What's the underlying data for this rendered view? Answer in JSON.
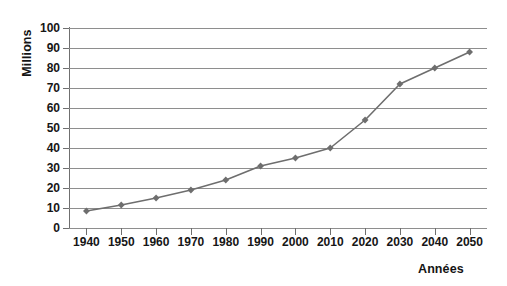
{
  "chart_data": {
    "type": "line",
    "title": "",
    "subtitle": "",
    "xlabel": "Années",
    "ylabel": "Millions",
    "categories": [
      "1940",
      "1950",
      "1960",
      "1970",
      "1980",
      "1990",
      "2000",
      "2010",
      "2020",
      "2030",
      "2040",
      "2050"
    ],
    "x": [
      1940,
      1950,
      1960,
      1970,
      1980,
      1990,
      2000,
      2010,
      2020,
      2030,
      2040,
      2050
    ],
    "values": [
      8.5,
      11.5,
      15,
      19,
      24,
      31,
      35,
      40,
      54,
      72,
      80,
      88
    ],
    "series": [
      {
        "name": "",
        "values": [
          8.5,
          11.5,
          15,
          19,
          24,
          31,
          35,
          40,
          54,
          72,
          80,
          88
        ]
      }
    ],
    "ylim": [
      0,
      100
    ],
    "ytick_labels": [
      "0",
      "10",
      "20",
      "30",
      "40",
      "50",
      "60",
      "70",
      "80",
      "90",
      "100"
    ],
    "ytick_values": [
      0,
      10,
      20,
      30,
      40,
      50,
      60,
      70,
      80,
      90,
      100
    ],
    "xtick_labels": [
      "1940",
      "1950",
      "1960",
      "1970",
      "1980",
      "1990",
      "2000",
      "2010",
      "2020",
      "2030",
      "2040",
      "2050"
    ],
    "grid": "horizontal",
    "legend": "none",
    "marker": "diamond",
    "line_color": "#6e6e6e",
    "marker_color": "#6e6e6e",
    "grid_color": "#8e8e8e",
    "axis_color": "#6f6f6f",
    "background": "#ffffff",
    "text_color": "#161616"
  },
  "axis": {
    "y_title": "Millions",
    "x_title": "Années"
  }
}
